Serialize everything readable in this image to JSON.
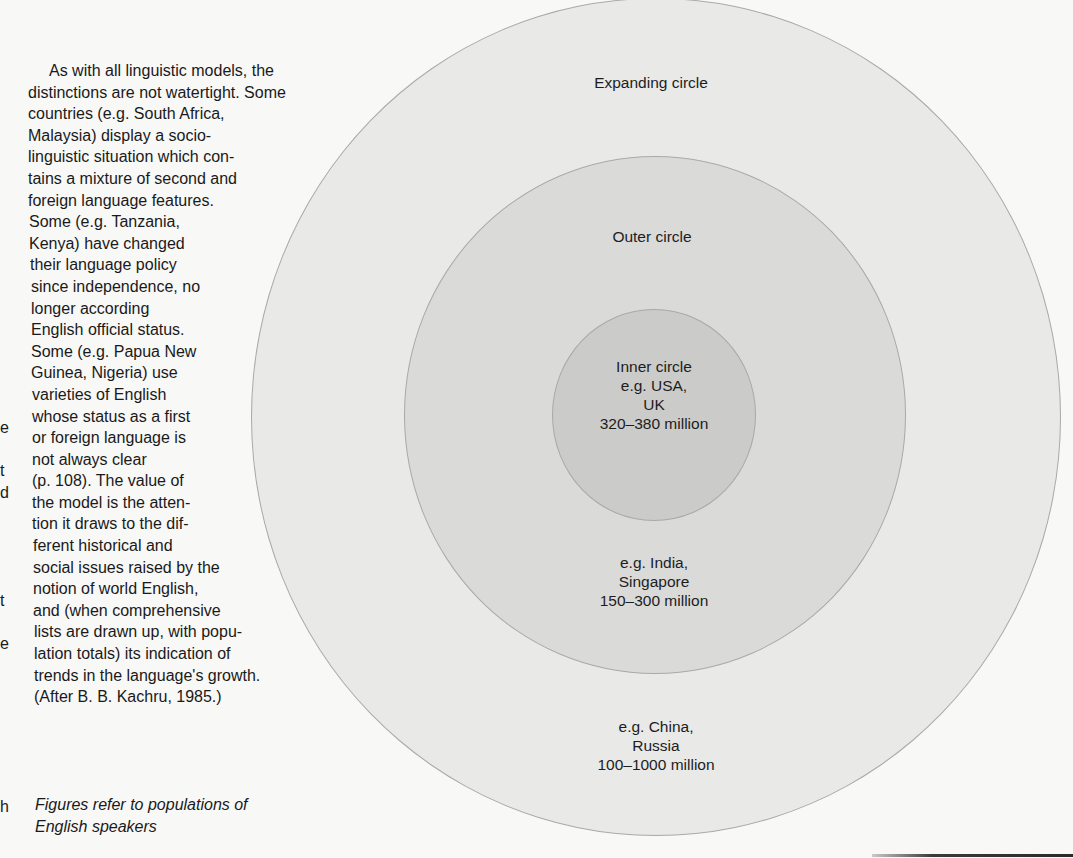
{
  "body_text": {
    "lines": [
      "As with all linguistic models, the",
      "distinctions are not watertight. Some",
      "countries (e.g. South Africa,",
      "Malaysia) display a socio-",
      "linguistic situation which con-",
      "tains a mixture of second and",
      "foreign language features.",
      "Some (e.g. Tanzania,",
      "Kenya) have changed",
      "their language policy",
      "since independence, no",
      "longer according",
      "English official status.",
      "Some (e.g. Papua New",
      "Guinea, Nigeria) use",
      "varieties of English",
      "whose status as a first",
      "or foreign language is",
      "not always clear",
      "(p. 108). The value of",
      "the model is the atten-",
      "tion it draws to the dif-",
      "ferent historical and",
      "social issues raised by the",
      "notion of world English,",
      "and (when comprehensive",
      "lists are drawn up, with popu-",
      "lation totals) its indication of",
      "trends in the language's growth.",
      "(After B. B. Kachru, 1985.)"
    ]
  },
  "caption": {
    "lines": [
      "Figures refer to populations of",
      "English speakers"
    ]
  },
  "edge_fragments": [
    {
      "text": "e",
      "top": 418
    },
    {
      "text": "t",
      "top": 461
    },
    {
      "text": "d",
      "top": 483
    },
    {
      "text": "t",
      "top": 591
    },
    {
      "text": "e",
      "top": 634
    },
    {
      "text": "h",
      "top": 797
    }
  ],
  "diagram": {
    "expanding_circle": {
      "title": "Expanding circle",
      "examples_line1": "e.g. China,",
      "examples_line2": "Russia",
      "population": "100–1000 million",
      "fill": "#e9e9e8"
    },
    "outer_circle": {
      "title": "Outer circle",
      "examples_line1": "e.g. India,",
      "examples_line2": "Singapore",
      "population": "150–300 million",
      "fill": "#dadad9"
    },
    "inner_circle": {
      "title": "Inner circle",
      "examples_line1": "e.g. USA,",
      "examples_line2": "UK",
      "population": "320–380 million",
      "fill": "#cbcbca"
    },
    "outline_color": "#a9a9a9"
  }
}
